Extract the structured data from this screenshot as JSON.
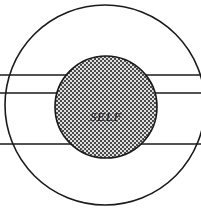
{
  "figure": {
    "name": "self-in-concentric-fields-diagram",
    "type": "concentric-circle-diagram",
    "canvas": {
      "width": 201,
      "height": 210,
      "background": "#ffffff"
    },
    "stroke_color": "#1a1a1a",
    "inner_fill_pattern": "stipple-dots",
    "inner_fill_color": "#d8d8d8",
    "inner_dot_color": "#3a3a3a",
    "outer_circle": {
      "label": "outer-boundary-circle",
      "cx": 105,
      "cy": 105,
      "r": 100,
      "stroke_width": 1.6,
      "fill": "none",
      "clipped_edges": "left-and-right"
    },
    "inner_circle": {
      "label": "self-circle",
      "cx": 106,
      "cy": 107,
      "r": 51,
      "stroke_width": 1.6
    },
    "center_label": "SELF",
    "horizontal_lines": [
      {
        "name": "line-upper",
        "y": 75,
        "x1": 0,
        "x2": 201,
        "stroke_width": 1.3
      },
      {
        "name": "line-middle",
        "y": 93,
        "x1": 0,
        "x2": 201,
        "stroke_width": 1.3
      },
      {
        "name": "line-lower",
        "y": 144,
        "x1": 0,
        "x2": 201,
        "stroke_width": 1.3
      }
    ]
  }
}
